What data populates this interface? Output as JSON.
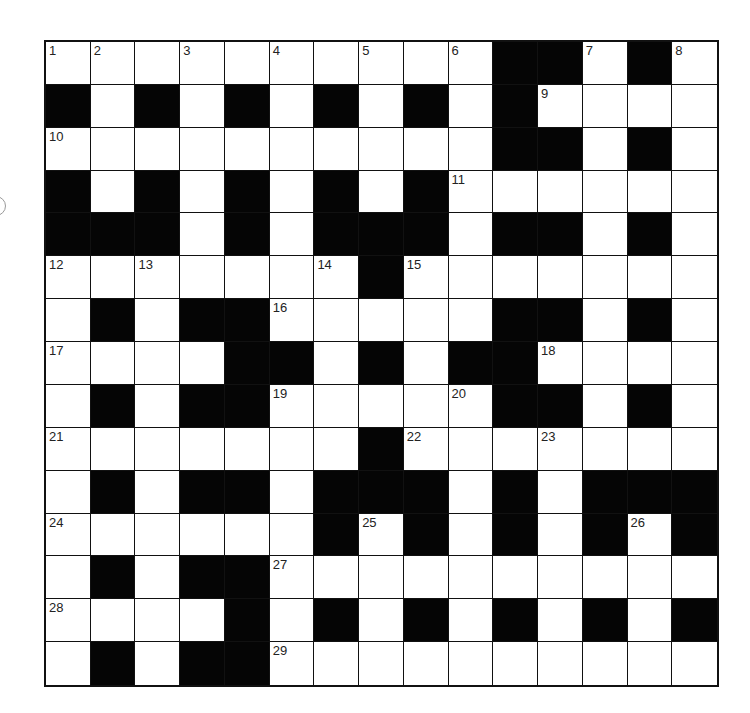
{
  "puzzle": {
    "type": "crossword",
    "rows": 15,
    "cols": 15,
    "layout": [
      "..........##.#.",
      "#.#.#.#.#.#....",
      "..........##.#.",
      "#.#.#.#.#......",
      "###.#.###.##.#.",
      ".......#.......",
      ".#.##.....##.#.",
      "....##.#.##....",
      ".#.##.....##.#.",
      ".......#.......",
      ".#.##.###.#.###",
      "......#.#.#.#.#",
      ".#.##..........",
      "....#.#.#.#.#.#",
      ".#.##.........."
    ],
    "numbers": [
      {
        "r": 0,
        "c": 0,
        "n": "1"
      },
      {
        "r": 0,
        "c": 1,
        "n": "2"
      },
      {
        "r": 0,
        "c": 3,
        "n": "3"
      },
      {
        "r": 0,
        "c": 5,
        "n": "4"
      },
      {
        "r": 0,
        "c": 7,
        "n": "5"
      },
      {
        "r": 0,
        "c": 9,
        "n": "6"
      },
      {
        "r": 0,
        "c": 12,
        "n": "7"
      },
      {
        "r": 0,
        "c": 14,
        "n": "8"
      },
      {
        "r": 1,
        "c": 11,
        "n": "9"
      },
      {
        "r": 2,
        "c": 0,
        "n": "10"
      },
      {
        "r": 3,
        "c": 9,
        "n": "11"
      },
      {
        "r": 5,
        "c": 0,
        "n": "12"
      },
      {
        "r": 5,
        "c": 2,
        "n": "13"
      },
      {
        "r": 5,
        "c": 6,
        "n": "14"
      },
      {
        "r": 5,
        "c": 8,
        "n": "15"
      },
      {
        "r": 6,
        "c": 5,
        "n": "16"
      },
      {
        "r": 7,
        "c": 0,
        "n": "17"
      },
      {
        "r": 7,
        "c": 11,
        "n": "18"
      },
      {
        "r": 8,
        "c": 5,
        "n": "19"
      },
      {
        "r": 8,
        "c": 9,
        "n": "20"
      },
      {
        "r": 9,
        "c": 0,
        "n": "21"
      },
      {
        "r": 9,
        "c": 8,
        "n": "22"
      },
      {
        "r": 9,
        "c": 11,
        "n": "23"
      },
      {
        "r": 11,
        "c": 0,
        "n": "24"
      },
      {
        "r": 11,
        "c": 7,
        "n": "25"
      },
      {
        "r": 11,
        "c": 13,
        "n": "26"
      },
      {
        "r": 12,
        "c": 5,
        "n": "27"
      },
      {
        "r": 13,
        "c": 0,
        "n": "28"
      },
      {
        "r": 14,
        "c": 5,
        "n": "29"
      }
    ]
  },
  "colors": {
    "white_cell": "#ffffff",
    "black_cell": "#050505",
    "border": "#111111",
    "number_text": "#222222"
  }
}
